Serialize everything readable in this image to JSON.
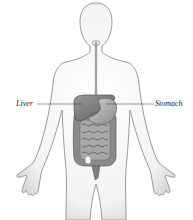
{
  "diagram": {
    "labels": [
      {
        "id": "liver",
        "text": "Liver"
      },
      {
        "id": "stomach",
        "text": "Stomach"
      }
    ],
    "parts": [
      "body-outline",
      "esophagus",
      "liver",
      "stomach",
      "small-intestine",
      "large-intestine",
      "rectum"
    ],
    "colors": {
      "outline": "#9a9a9a",
      "body_fill": "#f4f4f4",
      "organ_dark": "#6e6e6e",
      "organ_mid": "#8c8c8c",
      "organ_light": "#b5b5b5",
      "leader_line": "#333333"
    }
  }
}
